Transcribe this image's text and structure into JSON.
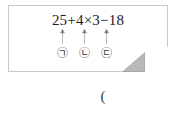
{
  "problem": {
    "expression": "25+4×3−18",
    "operands": [
      "25",
      "4",
      "3",
      "18"
    ],
    "operators": [
      "+",
      "×",
      "−"
    ],
    "markers": [
      {
        "symbol": "㉠",
        "letter": "ㄱ",
        "points_to": "+"
      },
      {
        "symbol": "㉡",
        "letter": "ㄴ",
        "points_to": "×"
      },
      {
        "symbol": "㉢",
        "letter": "ㄷ",
        "points_to": "−"
      }
    ],
    "answer_prompt": "(",
    "box": {
      "style": "folded-corner-note",
      "border_color": "#c9c9c9",
      "fold_color": "#b9b9b9",
      "background": "#ffffff"
    },
    "text_color": "#1c1c1c"
  }
}
